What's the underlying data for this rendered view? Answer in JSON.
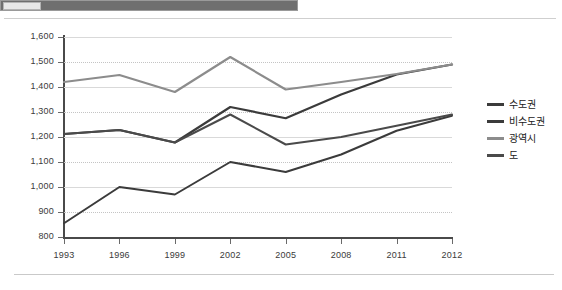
{
  "header": {
    "bar_label": "",
    "chip_label": ""
  },
  "chart_data": {
    "type": "line",
    "title": "",
    "xlabel": "",
    "ylabel": "",
    "x": [
      "1993",
      "1996",
      "1999",
      "2002",
      "2005",
      "2008",
      "2011",
      "2012"
    ],
    "ylim": [
      800,
      1600
    ],
    "ytick_labels": [
      "1,600",
      "1,500",
      "1,400",
      "1,300",
      "1,200",
      "1,100",
      "1,000",
      "900",
      "800"
    ],
    "ytick_values": [
      1600,
      1500,
      1400,
      1300,
      1200,
      1100,
      1000,
      900,
      800
    ],
    "grid": true,
    "legend_position": "right",
    "series": [
      {
        "name": "수도권",
        "color": "#3b3b3b",
        "width": 2.2,
        "values": [
          1212,
          1228,
          1178,
          1320,
          1275,
          1370,
          1450,
          1490
        ]
      },
      {
        "name": "비수도권",
        "color": "#3b3b3b",
        "width": 2.0,
        "values": [
          855,
          1000,
          970,
          1100,
          1060,
          1130,
          1225,
          1285
        ]
      },
      {
        "name": "광역시",
        "color": "#8c8c8c",
        "width": 2.2,
        "values": [
          1420,
          1448,
          1380,
          1520,
          1390,
          1420,
          1452,
          1490
        ]
      },
      {
        "name": "도",
        "color": "#4a4a4a",
        "width": 2.0,
        "values": [
          1212,
          1228,
          1178,
          1290,
          1170,
          1200,
          1245,
          1290
        ]
      }
    ]
  },
  "legend": {
    "items": [
      {
        "label": "수도권",
        "color": "#3b3b3b"
      },
      {
        "label": "비수도권",
        "color": "#3b3b3b"
      },
      {
        "label": "광역시",
        "color": "#8c8c8c"
      },
      {
        "label": "도",
        "color": "#4a4a4a"
      }
    ]
  }
}
